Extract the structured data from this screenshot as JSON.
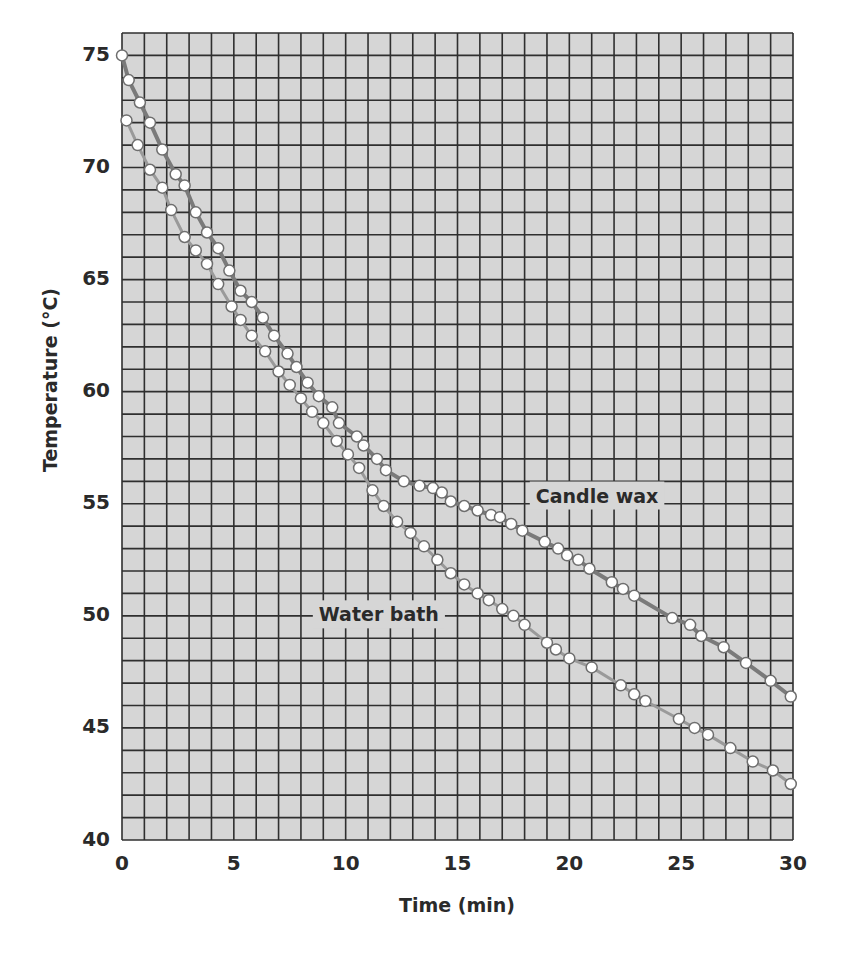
{
  "chart_data": {
    "type": "line",
    "title": "",
    "xlabel": "Time (min)",
    "ylabel": "Temperature (°C)",
    "xlim": [
      0,
      30
    ],
    "ylim": [
      40,
      76
    ],
    "x_ticks": [
      0,
      5,
      10,
      15,
      20,
      25,
      30
    ],
    "y_ticks": [
      40,
      45,
      50,
      55,
      60,
      65,
      70,
      75
    ],
    "grid": {
      "on": true,
      "x_step": 1,
      "y_step": 1
    },
    "legend": {
      "position": "inline labels"
    },
    "series": [
      {
        "name": "Candle wax",
        "label_pos": {
          "x": 18.5,
          "y": 55.3
        },
        "points": [
          [
            0,
            75.0
          ],
          [
            0.3,
            73.9
          ],
          [
            0.8,
            72.9
          ],
          [
            1.25,
            72.0
          ],
          [
            1.8,
            70.8
          ],
          [
            2.4,
            69.7
          ],
          [
            2.8,
            69.2
          ],
          [
            3.3,
            68.0
          ],
          [
            3.8,
            67.1
          ],
          [
            4.3,
            66.4
          ],
          [
            4.8,
            65.4
          ],
          [
            5.3,
            64.5
          ],
          [
            5.8,
            64.0
          ],
          [
            6.3,
            63.3
          ],
          [
            6.8,
            62.5
          ],
          [
            7.4,
            61.7
          ],
          [
            7.8,
            61.1
          ],
          [
            8.3,
            60.4
          ],
          [
            8.8,
            59.8
          ],
          [
            9.4,
            59.3
          ],
          [
            9.7,
            58.6
          ],
          [
            10.5,
            58.0
          ],
          [
            10.8,
            57.6
          ],
          [
            11.4,
            57.0
          ],
          [
            11.8,
            56.5
          ],
          [
            12.6,
            56.0
          ],
          [
            13.3,
            55.8
          ],
          [
            13.9,
            55.7
          ],
          [
            14.3,
            55.5
          ],
          [
            14.7,
            55.1
          ],
          [
            15.3,
            54.9
          ],
          [
            15.9,
            54.7
          ],
          [
            16.5,
            54.5
          ],
          [
            16.9,
            54.4
          ],
          [
            17.4,
            54.1
          ],
          [
            17.9,
            53.8
          ],
          [
            18.9,
            53.3
          ],
          [
            19.5,
            53.0
          ],
          [
            19.9,
            52.7
          ],
          [
            20.4,
            52.5
          ],
          [
            20.9,
            52.1
          ],
          [
            21.9,
            51.5
          ],
          [
            22.4,
            51.2
          ],
          [
            22.9,
            50.9
          ],
          [
            24.6,
            49.9
          ],
          [
            25.4,
            49.6
          ],
          [
            25.9,
            49.1
          ],
          [
            26.9,
            48.6
          ],
          [
            27.9,
            47.9
          ],
          [
            29.0,
            47.1
          ],
          [
            29.9,
            46.4
          ]
        ]
      },
      {
        "name": "Water bath",
        "label_pos": {
          "x": 8.8,
          "y": 50.0
        },
        "points": [
          [
            0.2,
            72.1
          ],
          [
            0.7,
            71.0
          ],
          [
            1.25,
            69.9
          ],
          [
            1.8,
            69.1
          ],
          [
            2.2,
            68.1
          ],
          [
            2.8,
            66.9
          ],
          [
            3.3,
            66.3
          ],
          [
            3.8,
            65.7
          ],
          [
            4.3,
            64.8
          ],
          [
            4.9,
            63.8
          ],
          [
            5.3,
            63.2
          ],
          [
            5.8,
            62.5
          ],
          [
            6.4,
            61.8
          ],
          [
            7.0,
            60.9
          ],
          [
            7.5,
            60.3
          ],
          [
            8.0,
            59.7
          ],
          [
            8.5,
            59.1
          ],
          [
            9.0,
            58.6
          ],
          [
            9.6,
            57.8
          ],
          [
            10.1,
            57.2
          ],
          [
            10.6,
            56.6
          ],
          [
            11.2,
            55.6
          ],
          [
            11.7,
            54.9
          ],
          [
            12.3,
            54.2
          ],
          [
            12.9,
            53.7
          ],
          [
            13.5,
            53.1
          ],
          [
            14.1,
            52.5
          ],
          [
            14.7,
            51.9
          ],
          [
            15.3,
            51.4
          ],
          [
            15.9,
            51.0
          ],
          [
            16.4,
            50.7
          ],
          [
            17.0,
            50.3
          ],
          [
            17.5,
            50.0
          ],
          [
            18.0,
            49.6
          ],
          [
            19.0,
            48.8
          ],
          [
            19.4,
            48.5
          ],
          [
            20.0,
            48.1
          ],
          [
            21.0,
            47.7
          ],
          [
            22.3,
            46.9
          ],
          [
            22.9,
            46.5
          ],
          [
            23.4,
            46.2
          ],
          [
            24.9,
            45.4
          ],
          [
            25.6,
            45.0
          ],
          [
            26.2,
            44.7
          ],
          [
            27.2,
            44.1
          ],
          [
            28.2,
            43.5
          ],
          [
            29.1,
            43.1
          ],
          [
            29.9,
            42.5
          ]
        ]
      }
    ],
    "colors": {
      "plot_bg": "#d6d6d6",
      "grid": "#2f2f2f",
      "candle_line": "#7a7a7a",
      "water_line": "#9a9a9a",
      "marker_fill": "#ffffff",
      "marker_stroke": "#6e6e6e",
      "text": "#2a2a2a"
    }
  }
}
